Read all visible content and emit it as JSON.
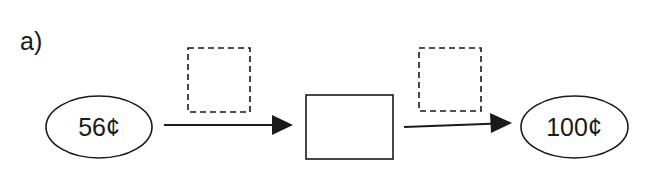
{
  "part_label": "a)",
  "start": {
    "value": "56¢"
  },
  "end": {
    "value": "100¢"
  },
  "placeholders": {
    "operator_box_1": "",
    "operator_box_2": "",
    "middle_box": ""
  },
  "colors": {
    "stroke": "#1a1a1a",
    "background": "#ffffff"
  }
}
